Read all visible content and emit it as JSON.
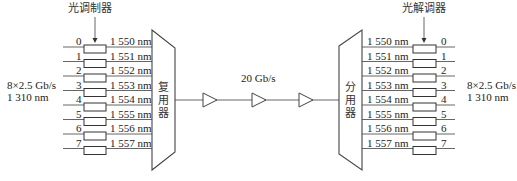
{
  "diagram": {
    "type": "WDM optical transmission system",
    "transmitter": {
      "modulator_label": "光调制器",
      "mux_label": [
        "复",
        "用",
        "器"
      ],
      "input_rate": "8×2.5 Gb/s",
      "input_wavelength": "1 310 nm",
      "channels": [
        {
          "index": "0",
          "wavelength": "1 550 nm"
        },
        {
          "index": "1",
          "wavelength": "1 551 nm"
        },
        {
          "index": "2",
          "wavelength": "1 552 nm"
        },
        {
          "index": "3",
          "wavelength": "1 553 nm"
        },
        {
          "index": "4",
          "wavelength": "1 554 nm"
        },
        {
          "index": "5",
          "wavelength": "1 555 nm"
        },
        {
          "index": "6",
          "wavelength": "1 556 nm"
        },
        {
          "index": "7",
          "wavelength": "1 557 nm"
        }
      ]
    },
    "link": {
      "rate": "20 Gb/s",
      "amplifier_count": 3
    },
    "receiver": {
      "demodulator_label": "光解调器",
      "demux_label": [
        "分",
        "用",
        "器"
      ],
      "output_rate": "8×2.5 Gb/s",
      "output_wavelength": "1 310 nm",
      "channels": [
        {
          "index": "0",
          "wavelength": "1 550 nm"
        },
        {
          "index": "1",
          "wavelength": "1 551 nm"
        },
        {
          "index": "2",
          "wavelength": "1 552 nm"
        },
        {
          "index": "3",
          "wavelength": "1 553 nm"
        },
        {
          "index": "4",
          "wavelength": "1 554 nm"
        },
        {
          "index": "5",
          "wavelength": "1 555 nm"
        },
        {
          "index": "6",
          "wavelength": "1 556 nm"
        },
        {
          "index": "7",
          "wavelength": "1 557 nm"
        }
      ]
    },
    "colors": {
      "line": "#555555",
      "text": "#222222",
      "background": "#ffffff"
    }
  }
}
